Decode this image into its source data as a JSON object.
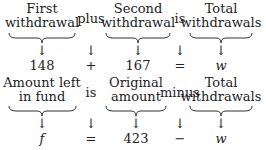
{
  "rows": [
    {
      "terms": [
        {
          "label_lines": [
            "First",
            "withdrawal"
          ],
          "value": "148",
          "braced": true
        },
        {
          "label_lines": [
            "plus"
          ],
          "value": "+",
          "braced": false
        },
        {
          "label_lines": [
            "Second",
            "withdrawal"
          ],
          "value": "167",
          "braced": true
        },
        {
          "label_lines": [
            "is"
          ],
          "value": "=",
          "braced": false
        },
        {
          "label_lines": [
            "Total",
            "withdrawals"
          ],
          "value": "w",
          "braced": true
        }
      ]
    },
    {
      "terms": [
        {
          "label_lines": [
            "Amount left",
            "in fund"
          ],
          "value": "f",
          "braced": true
        },
        {
          "label_lines": [
            "is"
          ],
          "value": "=",
          "braced": false
        },
        {
          "label_lines": [
            "Original",
            "amount"
          ],
          "value": "423",
          "braced": true
        },
        {
          "label_lines": [
            "minus"
          ],
          "value": "−",
          "braced": false
        },
        {
          "label_lines": [
            "Total",
            "withdrawals"
          ],
          "value": "w",
          "braced": true
        }
      ]
    }
  ],
  "arrow_glyph": "↓"
}
